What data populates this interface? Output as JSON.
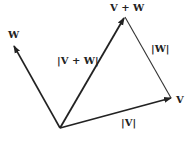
{
  "diagram": {
    "vectors": [
      {
        "id": "W",
        "label": "W",
        "from": "origin",
        "to": "W"
      },
      {
        "id": "VplusW",
        "label": "V + W",
        "from": "origin",
        "to": "V+W",
        "magnitude_label": "|V + W|"
      },
      {
        "id": "V",
        "label": "V",
        "from": "origin",
        "to": "V",
        "magnitude_label": "|V|"
      }
    ],
    "edge": {
      "id": "W-translated",
      "from": "V",
      "to": "V+W",
      "magnitude_label": "|W|"
    },
    "labels": {
      "w": "W",
      "v_plus_w": "V + W",
      "mag_v_plus_w": "|V + W|",
      "mag_w": "|W|",
      "v": "V",
      "mag_v": "|V|"
    },
    "colors": {
      "ink": "#222222",
      "background": "#ffffff"
    }
  }
}
